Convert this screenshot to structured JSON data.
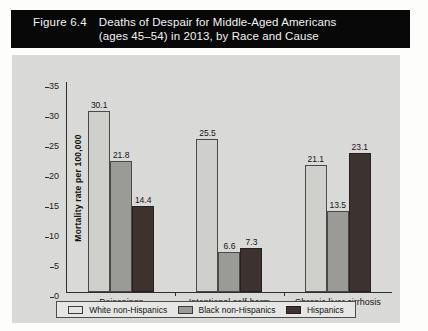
{
  "figure": {
    "number_label": "Figure 6.4",
    "title": "Deaths of Despair for Middle-Aged Americans\n(ages 45–54) in 2013, by Race and Cause"
  },
  "chart_data": {
    "type": "bar",
    "title": "Deaths of Despair for Middle-Aged Americans (ages 45–54) in 2013, by Race and Cause",
    "xlabel": "",
    "ylabel": "Mortality rate per 100,000",
    "ylim": [
      0,
      35
    ],
    "yticks": [
      "0",
      "5",
      "10",
      "15",
      "20",
      "25",
      "30",
      "35"
    ],
    "grid": false,
    "legend_position": "bottom",
    "categories": [
      "Poisonings",
      "Intentional self-harm",
      "Chronic liver cirrhosis"
    ],
    "series": [
      {
        "name": "White non-Hispanics",
        "color": "#cfcfcb",
        "values": [
          30.1,
          25.5,
          21.1
        ]
      },
      {
        "name": "Black non-Hispanics",
        "color": "#9a9a96",
        "values": [
          21.8,
          6.6,
          13.5
        ]
      },
      {
        "name": "Hispanics",
        "color": "#3c3230",
        "values": [
          14.4,
          7.3,
          23.1
        ]
      }
    ]
  }
}
